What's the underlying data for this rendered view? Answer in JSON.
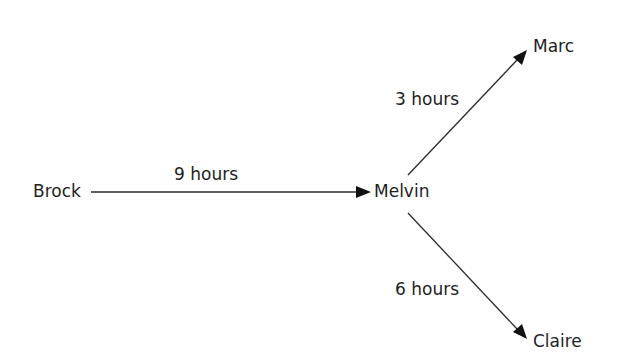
{
  "diagram": {
    "type": "directed-graph",
    "nodes": [
      {
        "id": "brock",
        "label": "Brock"
      },
      {
        "id": "melvin",
        "label": "Melvin"
      },
      {
        "id": "marc",
        "label": "Marc"
      },
      {
        "id": "claire",
        "label": "Claire"
      }
    ],
    "edges": [
      {
        "from": "brock",
        "to": "melvin",
        "label": "9 hours"
      },
      {
        "from": "melvin",
        "to": "marc",
        "label": "3 hours"
      },
      {
        "from": "melvin",
        "to": "claire",
        "label": "6 hours"
      }
    ],
    "colors": {
      "background": "#ffffff",
      "text": "#1e1e1e",
      "line": "#2a2a2a"
    }
  }
}
